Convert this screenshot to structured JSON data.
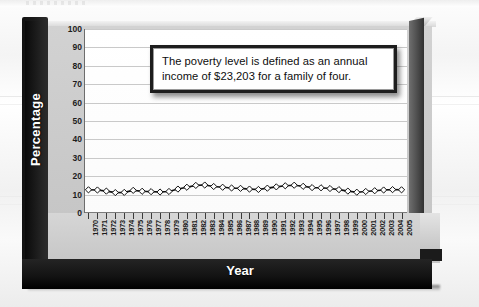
{
  "chart_data": {
    "type": "line",
    "title": "",
    "subtitle": "",
    "xlabel": "Year",
    "ylabel": "Percentage",
    "ylim": [
      0,
      100
    ],
    "ytick_step": 10,
    "yticks": [
      100,
      90,
      80,
      70,
      60,
      50,
      40,
      30,
      20,
      10,
      0
    ],
    "grid": true,
    "legend": "none",
    "marker": "diamond",
    "line_color": "#101010",
    "marker_fill": "#ffffff",
    "marker_edge": "#101010",
    "categories": [
      "1970",
      "1971",
      "1972",
      "1973",
      "1974",
      "1975",
      "1976",
      "1977",
      "1978",
      "1979",
      "1980",
      "1981",
      "1982",
      "1983",
      "1984",
      "1985",
      "1986",
      "1987",
      "1988",
      "1989",
      "1990",
      "1991",
      "1992",
      "1993",
      "1994",
      "1995",
      "1996",
      "1997",
      "1998",
      "1999",
      "2000",
      "2001",
      "2002",
      "2003",
      "2004",
      "2005"
    ],
    "series": [
      {
        "name": "Poverty rate",
        "values": [
          12.6,
          12.5,
          11.9,
          11.1,
          11.2,
          12.3,
          11.8,
          11.6,
          11.4,
          11.7,
          13.0,
          14.0,
          15.0,
          15.2,
          14.4,
          14.0,
          13.6,
          13.4,
          13.0,
          12.8,
          13.5,
          14.2,
          14.8,
          15.1,
          14.5,
          13.8,
          13.7,
          13.3,
          12.7,
          11.9,
          11.3,
          11.7,
          12.1,
          12.5,
          12.7,
          12.6
        ]
      }
    ],
    "annotations": [
      {
        "name": "poverty-level-callout",
        "text": "The poverty level is defined as an annual income of $23,203 for a family of four."
      }
    ]
  },
  "chart": {
    "y_axis_title": "Percentage",
    "x_axis_title": "Year",
    "callout_text": "The poverty level is defined as an annual income of $23,203 for a family of four."
  }
}
